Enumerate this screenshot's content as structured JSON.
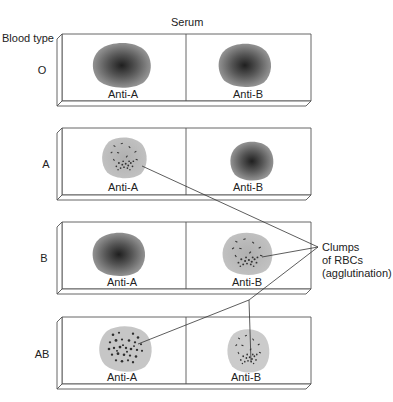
{
  "title": "Serum",
  "row_header": "Blood type",
  "callout": {
    "line1": "Clumps",
    "line2": "of RBCs",
    "line3": "(agglutination)"
  },
  "columns": [
    "Anti-A",
    "Anti-B"
  ],
  "rows": [
    {
      "type": "O",
      "anti_a": "Anti-A",
      "anti_b": "Anti-B",
      "anti_a_agglutinated": false,
      "anti_b_agglutinated": false
    },
    {
      "type": "A",
      "anti_a": "Anti-A",
      "anti_b": "Anti-B",
      "anti_a_agglutinated": true,
      "anti_b_agglutinated": false
    },
    {
      "type": "B",
      "anti_a": "Anti-A",
      "anti_b": "Anti-B",
      "anti_a_agglutinated": false,
      "anti_b_agglutinated": true
    },
    {
      "type": "AB",
      "anti_a": "Anti-A",
      "anti_b": "Anti-B",
      "anti_a_agglutinated": true,
      "anti_b_agglutinated": true
    }
  ],
  "colors": {
    "slide_stroke": "#555555",
    "drop_dark": "#2a2a2a",
    "drop_edge": "#8a8a8a",
    "clump_bg": "#b9b9b9",
    "clump_dots": "#333333",
    "leader_line": "#333333"
  }
}
